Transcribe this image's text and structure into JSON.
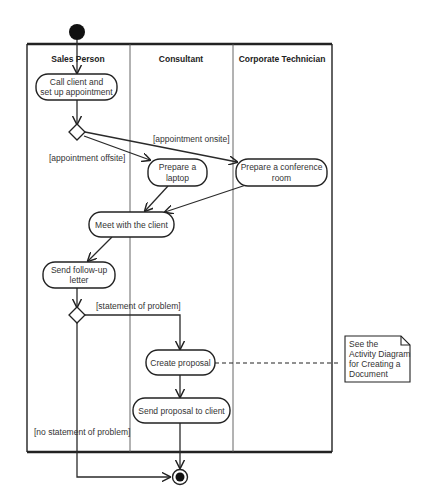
{
  "diagram": {
    "type": "UML activity diagram with swimlanes",
    "colors": {
      "line": "#222222",
      "text": "#333333",
      "background": "#ffffff",
      "node_fill": "#ffffff",
      "start_fill": "#111111"
    },
    "lanes": [
      {
        "id": "sales",
        "label": "Sales Person"
      },
      {
        "id": "consultant",
        "label": "Consultant"
      },
      {
        "id": "technician",
        "label": "Corporate Technician"
      }
    ],
    "nodes": {
      "call_client": {
        "line1": "Call client and",
        "line2": "set up appointment"
      },
      "prepare_laptop": {
        "line1": "Prepare a",
        "line2": "laptop"
      },
      "prepare_room": {
        "line1": "Prepare a conference",
        "line2": "room"
      },
      "meet_client": {
        "line1": "Meet with the client"
      },
      "follow_up": {
        "line1": "Send follow-up",
        "line2": "letter"
      },
      "create_proposal": {
        "line1": "Create proposal"
      },
      "send_proposal": {
        "line1": "Send proposal to client"
      }
    },
    "guards": {
      "onsite": "[appointment onsite]",
      "offsite": "[appointment offsite]",
      "statement": "[statement of problem]",
      "no_statement": "[no statement of problem]"
    },
    "note": {
      "line1": "See the",
      "line2": "Activity Diagram",
      "line3": "for Creating a",
      "line4": "Document"
    }
  }
}
